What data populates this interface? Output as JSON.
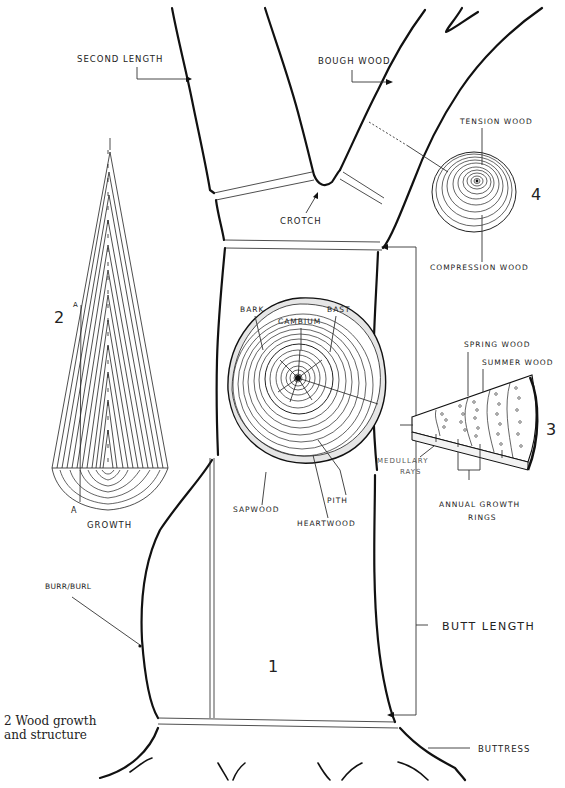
{
  "figure": {
    "caption_line1": "2   Wood growth",
    "caption_line2": "and structure"
  },
  "tree": {
    "labels": {
      "second_length": "SECOND LENGTH",
      "bough_wood": "BOUGH WOOD",
      "crotch": "CROTCH",
      "butt_length": "BUTT LENGTH",
      "buttress": "BUTTRESS",
      "burr_burl": "BURR/BURL"
    },
    "section_number": "1"
  },
  "cross_section": {
    "labels": {
      "bark": "BARK",
      "cambium": "CAMBIUM",
      "bast": "BAST",
      "sapwood": "SAPWOOD",
      "pith": "PITH",
      "heartwood": "HEARTWOOD",
      "medullary_rays_line1": "MEDULLARY",
      "medullary_rays_line2": "RAYS"
    }
  },
  "growth_cone": {
    "number": "2",
    "marker_top": "A",
    "marker_bottom": "A",
    "label": "GROWTH"
  },
  "wedge": {
    "number": "3",
    "labels": {
      "spring_wood": "SPRING WOOD",
      "summer_wood": "SUMMER WOOD",
      "annual_rings_line1": "ANNUAL GROWTH",
      "annual_rings_line2": "RINGS"
    }
  },
  "reaction_wood": {
    "number": "4",
    "labels": {
      "tension_wood": "TENSION WOOD",
      "compression_wood": "COMPRESSION WOOD"
    }
  }
}
